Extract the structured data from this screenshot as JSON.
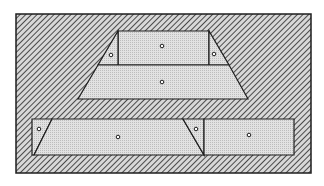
{
  "figure": {
    "colors": {
      "background": "#ffffff",
      "hatch_line": "#3a3a3a",
      "hatch_bg": "#d8d8d8",
      "piece_fill": "#dcdcdc",
      "outline": "#1e1e1e",
      "pin": "#ffffff"
    },
    "frame": {
      "x": 16,
      "y": 14,
      "width": 295,
      "height": 159
    },
    "top_assembly": {
      "pieces": [
        {
          "id": "top-rect",
          "points": "118,31 209,31 209,65 118,65",
          "pin": [
            162,
            46
          ]
        },
        {
          "id": "top-left-triangle",
          "points": "118,31 118,65 98,65",
          "pin": [
            111,
            55
          ]
        },
        {
          "id": "top-right-triangle",
          "points": "209,31 209,65 229,65",
          "pin": [
            214,
            54
          ]
        },
        {
          "id": "top-trapezoid-base",
          "points": "98,65 229,65 248,99 78,99",
          "pin": [
            162,
            82
          ]
        }
      ]
    },
    "bottom_assembly": {
      "pieces": [
        {
          "id": "bottom-left-triangle",
          "points": "32,119 52,119 34,155 32,155",
          "pin": [
            39,
            129
          ]
        },
        {
          "id": "bottom-parallelogram",
          "points": "52,119 183,119 204,155 34,155",
          "pin": [
            118,
            137
          ]
        },
        {
          "id": "bottom-mid-triangle",
          "points": "183,119 204,119 204,155",
          "pin": [
            196,
            129
          ]
        },
        {
          "id": "bottom-right-rect",
          "points": "204,119 294,119 294,155 204,155",
          "pin": [
            249,
            135
          ]
        }
      ]
    }
  }
}
